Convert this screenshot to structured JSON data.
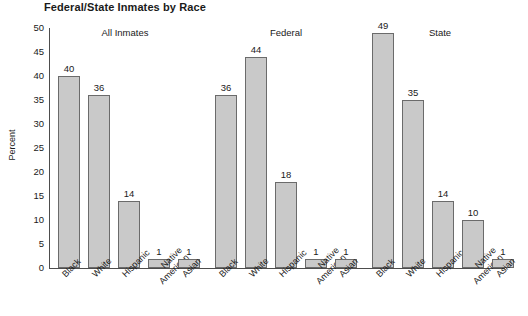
{
  "chart_data": {
    "type": "bar",
    "title": "Federal/State Inmates by Race",
    "xlabel": "",
    "ylabel": "Percent",
    "ylim": [
      0,
      50
    ],
    "ytick_step": 5,
    "yticks": [
      50,
      45,
      40,
      35,
      30,
      25,
      20,
      15,
      10,
      5,
      0
    ],
    "grid": false,
    "legend": "none",
    "bar_color": "#c9c9c9",
    "bar_border_color": "#6b6b6b",
    "categories": [
      "Black",
      "White",
      "Hispanic",
      "Native American",
      "Asian"
    ],
    "groups": [
      {
        "name": "All Inmates",
        "values": [
          40,
          36,
          14,
          1,
          1
        ]
      },
      {
        "name": "Federal",
        "values": [
          36,
          44,
          18,
          1,
          1
        ]
      },
      {
        "name": "State",
        "values": [
          49,
          35,
          14,
          10,
          1
        ]
      }
    ],
    "series": [
      {
        "name": "All Inmates",
        "values": [
          40,
          36,
          14,
          1,
          1
        ]
      },
      {
        "name": "Federal",
        "values": [
          36,
          44,
          18,
          1,
          1
        ]
      },
      {
        "name": "State",
        "values": [
          49,
          35,
          14,
          10,
          1
        ]
      }
    ]
  }
}
